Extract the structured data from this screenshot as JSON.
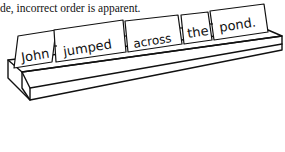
{
  "caption": {
    "text": "de, incorrect order is apparent."
  },
  "illustration": {
    "subject": "sentence-strip-holder",
    "cards": [
      {
        "word": "John"
      },
      {
        "word": "jumped"
      },
      {
        "word": "across"
      },
      {
        "word": "the"
      },
      {
        "word": "pond."
      }
    ],
    "colors": {
      "line": "#111111",
      "background": "#ffffff"
    }
  }
}
